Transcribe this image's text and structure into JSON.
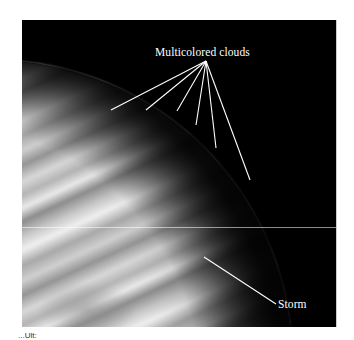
{
  "figure": {
    "background_color": "#000000",
    "labels": {
      "clouds": "Multicolored clouds",
      "storm": "Storm"
    },
    "caption_fragment": "...Ult:"
  }
}
